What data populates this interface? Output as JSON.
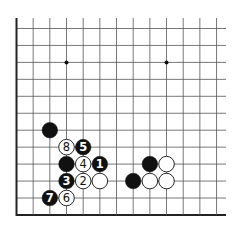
{
  "diagram": {
    "type": "go-board-diagram",
    "board": {
      "columns": 13,
      "rows": 12,
      "edges": [
        "left",
        "bottom"
      ],
      "star_points": [
        [
          3,
          2
        ],
        [
          9,
          2
        ]
      ]
    },
    "colors": {
      "black": "#111111",
      "white": "#ffffff",
      "line": "#555555",
      "edge": "#222222"
    },
    "stones": [
      {
        "color": "black",
        "col": 2,
        "row": 6,
        "label": ""
      },
      {
        "color": "white",
        "col": 3,
        "row": 7,
        "label": "8"
      },
      {
        "color": "black",
        "col": 4,
        "row": 7,
        "label": "5"
      },
      {
        "color": "black",
        "col": 3,
        "row": 8,
        "label": ""
      },
      {
        "color": "white",
        "col": 4,
        "row": 8,
        "label": "4"
      },
      {
        "color": "black",
        "col": 5,
        "row": 8,
        "label": "1"
      },
      {
        "color": "black",
        "col": 3,
        "row": 9,
        "label": "3"
      },
      {
        "color": "white",
        "col": 4,
        "row": 9,
        "label": "2"
      },
      {
        "color": "white",
        "col": 5,
        "row": 9,
        "label": ""
      },
      {
        "color": "black",
        "col": 2,
        "row": 10,
        "label": "7"
      },
      {
        "color": "white",
        "col": 3,
        "row": 10,
        "label": "6"
      },
      {
        "color": "black",
        "col": 8,
        "row": 8,
        "label": ""
      },
      {
        "color": "white",
        "col": 9,
        "row": 8,
        "label": ""
      },
      {
        "color": "black",
        "col": 7,
        "row": 9,
        "label": ""
      },
      {
        "color": "white",
        "col": 8,
        "row": 9,
        "label": ""
      },
      {
        "color": "white",
        "col": 9,
        "row": 9,
        "label": ""
      }
    ]
  }
}
